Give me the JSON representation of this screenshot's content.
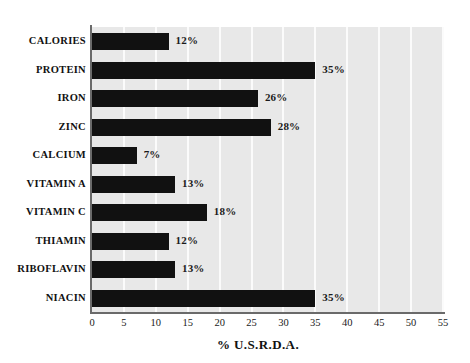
{
  "chart_data": {
    "type": "bar",
    "orientation": "horizontal",
    "title": "",
    "subtitle": "",
    "xlabel": "% U.S.R.D.A.",
    "ylabel": "",
    "xlim": [
      0,
      55
    ],
    "xticks": [
      0,
      5,
      10,
      15,
      20,
      25,
      30,
      35,
      40,
      45,
      50,
      55
    ],
    "xtick_labels": [
      "0",
      "5",
      "10",
      "15",
      "20",
      "25",
      "30",
      "35",
      "40",
      "45",
      "50",
      "55"
    ],
    "grid": true,
    "grid_axis": "x",
    "legend": false,
    "legend_position": "none",
    "categories": [
      "CALORIES",
      "PROTEIN",
      "IRON",
      "ZINC",
      "CALCIUM",
      "VITAMIN A",
      "VITAMIN C",
      "THIAMIN",
      "RIBOFLAVIN",
      "NIACIN"
    ],
    "values": [
      12,
      35,
      26,
      28,
      7,
      13,
      18,
      12,
      13,
      35
    ],
    "data_labels": [
      "12%",
      "35%",
      "26%",
      "28%",
      "7%",
      "13%",
      "18%",
      "12%",
      "13%",
      "35%"
    ],
    "series": [
      {
        "name": "% U.S.R.D.A.",
        "values": [
          12,
          35,
          26,
          28,
          7,
          13,
          18,
          12,
          13,
          35
        ]
      }
    ],
    "colors": {
      "bar": "#111111",
      "plot_background": "#e8e8e8",
      "gridline": "#fbfbfb",
      "axis": "#6a6a6a",
      "text": "#111111",
      "page_background": "#ffffff"
    }
  }
}
